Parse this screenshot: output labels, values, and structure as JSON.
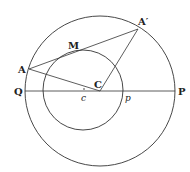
{
  "diagram": {
    "type": "geometry",
    "outer_circle": {
      "cx": 100,
      "cy": 91,
      "r": 75
    },
    "inner_circle": {
      "cx": 83,
      "cy": 90,
      "r": 40
    },
    "points": {
      "A": {
        "label": "A",
        "x": 29,
        "y": 69
      },
      "A_prime": {
        "label": "A′",
        "x": 138,
        "y": 29
      },
      "M": {
        "label": "M",
        "x": 77,
        "y": 52
      },
      "C": {
        "label": "C",
        "x": 100,
        "y": 91
      },
      "c": {
        "label": "c",
        "x": 84,
        "y": 91
      },
      "p": {
        "label": "p",
        "x": 123,
        "y": 91
      },
      "Q": {
        "label": "Q",
        "x": 25,
        "y": 91
      },
      "P": {
        "label": "P",
        "x": 175,
        "y": 91
      }
    },
    "segments": [
      [
        "Q",
        "P"
      ],
      [
        "A",
        "A_prime"
      ],
      [
        "A",
        "C"
      ],
      [
        "C",
        "A_prime"
      ]
    ],
    "stroke_color": "#333333"
  }
}
